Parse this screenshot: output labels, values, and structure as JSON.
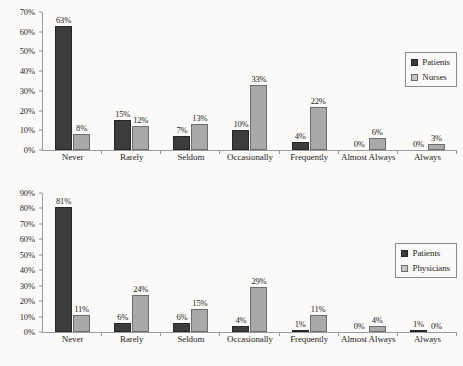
{
  "chart_data": [
    {
      "type": "bar",
      "id": "patients-vs-nurses",
      "title": "",
      "xlabel": "",
      "ylabel": "",
      "ylim": [
        0,
        70
      ],
      "ytick_step": 10,
      "ytick_labels": [
        "0%",
        "10%",
        "20%",
        "30%",
        "40%",
        "50%",
        "60%",
        "70%"
      ],
      "grid": false,
      "legend_position": "top-right-inside",
      "categories": [
        "Never",
        "Rarely",
        "Seldom",
        "Occasionally",
        "Frequently",
        "Almost Always",
        "Always"
      ],
      "series": [
        {
          "name": "Patients",
          "color": "#3c3c3c",
          "values": [
            63,
            15,
            7,
            10,
            4,
            0,
            0
          ],
          "labels": [
            "63%",
            "15%",
            "7%",
            "10%",
            "4%",
            "0%",
            "0%"
          ]
        },
        {
          "name": "Nurses",
          "color": "#a9a9a9",
          "values": [
            8,
            12,
            13,
            33,
            22,
            6,
            3
          ],
          "labels": [
            "8%",
            "12%",
            "13%",
            "33%",
            "22%",
            "6%",
            "3%"
          ]
        }
      ]
    },
    {
      "type": "bar",
      "id": "patients-vs-physicians",
      "title": "",
      "xlabel": "",
      "ylabel": "",
      "ylim": [
        0,
        90
      ],
      "ytick_step": 10,
      "ytick_labels": [
        "0%",
        "10%",
        "20%",
        "30%",
        "40%",
        "50%",
        "60%",
        "70%",
        "80%",
        "90%"
      ],
      "grid": false,
      "legend_position": "top-right-inside",
      "categories": [
        "Never",
        "Rarely",
        "Seldom",
        "Occasionally",
        "Frequently",
        "Almost Always",
        "Always"
      ],
      "series": [
        {
          "name": "Patients",
          "color": "#3c3c3c",
          "values": [
            81,
            6,
            6,
            4,
            1,
            0,
            1
          ],
          "labels": [
            "81%",
            "6%",
            "6%",
            "4%",
            "1%",
            "0%",
            "1%"
          ]
        },
        {
          "name": "Physicians",
          "color": "#a9a9a9",
          "values": [
            11,
            24,
            15,
            29,
            11,
            4,
            0
          ],
          "labels": [
            "11%",
            "24%",
            "15%",
            "29%",
            "11%",
            "4%",
            "0%"
          ]
        }
      ]
    }
  ]
}
